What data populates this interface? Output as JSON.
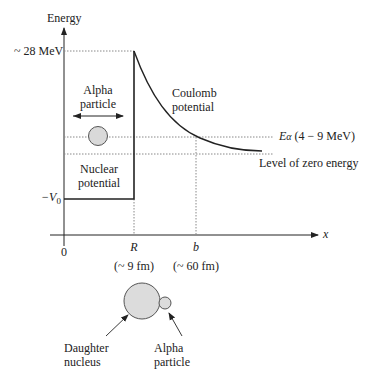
{
  "diagram": {
    "axes": {
      "y_label": "Energy",
      "x_label": "x",
      "origin_label": "0"
    },
    "energy_levels": {
      "barrier_top": "~ 28 MeV",
      "well_depth": "−V",
      "well_depth_sub": "0",
      "alpha_energy": "E",
      "alpha_energy_sub": "α",
      "alpha_energy_range": "(4 − 9 MeV)",
      "zero_level": "Level of zero energy"
    },
    "x_marks": [
      {
        "symbol": "R",
        "value": "(~ 9 fm)"
      },
      {
        "symbol": "b",
        "value": "(~ 60 fm)"
      }
    ],
    "region_labels": {
      "alpha_particle_line1": "Alpha",
      "alpha_particle_line2": "particle",
      "coulomb_line1": "Coulomb",
      "coulomb_line2": "potential",
      "nuclear_line1": "Nuclear",
      "nuclear_line2": "potential"
    },
    "inset": {
      "daughter_line1": "Daughter",
      "daughter_line2": "nucleus",
      "alpha_line1": "Alpha",
      "alpha_line2": "particle"
    },
    "colors": {
      "line": "#222222",
      "dotted": "#888888",
      "particle_fill": "#d9d9d9",
      "particle_stroke": "#555555"
    }
  }
}
